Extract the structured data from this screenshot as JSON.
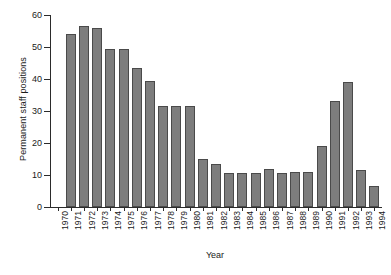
{
  "chart_data": {
    "type": "bar",
    "title": "",
    "xlabel": "Year",
    "ylabel": "Permanent staff positions",
    "categories": [
      "1970",
      "1971",
      "1972",
      "1973",
      "1974",
      "1975",
      "1976",
      "1977",
      "1978",
      "1979",
      "1980",
      "1981",
      "1982",
      "1983",
      "1984",
      "1985",
      "1986",
      "1987",
      "1988",
      "1989",
      "1990",
      "1991",
      "1992",
      "1993",
      "1994"
    ],
    "values": [
      0,
      54,
      56.5,
      56,
      49.5,
      49.5,
      43.5,
      39.5,
      31.5,
      31.5,
      31.5,
      15,
      13.5,
      10.5,
      10.5,
      10.5,
      12,
      10.5,
      11,
      11,
      19,
      33,
      39,
      11.5,
      6.5
    ],
    "ylim": [
      0,
      60
    ],
    "yticks": [
      0,
      10,
      20,
      30,
      40,
      50,
      60
    ],
    "ytick_labels": [
      "0",
      "10",
      "20",
      "30",
      "40",
      "50",
      "60"
    ],
    "grid": false,
    "legend": false,
    "bar_color": "#7d7d7d",
    "bar_edge_color": "#4a4a4a",
    "axis_color": "#2b2b2b",
    "background": "#ffffff"
  }
}
